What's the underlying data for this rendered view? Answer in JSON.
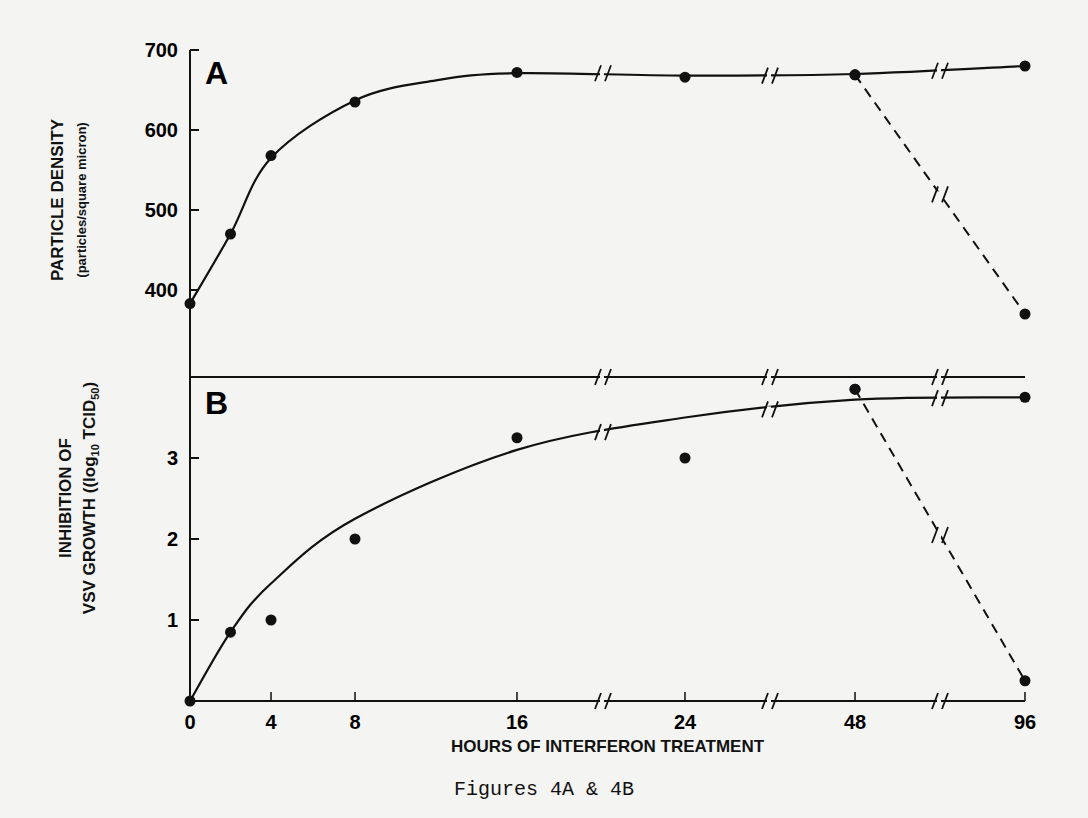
{
  "caption": "Figures 4A & 4B",
  "chart_data": [
    {
      "panel": "A",
      "type": "line",
      "title": "",
      "xlabel": "HOURS OF INTERFERON TREATMENT",
      "ylabel": "PARTICLE DENSITY",
      "ylabel_units": "(particles/square micron)",
      "x_ticks": [
        "0",
        "4",
        "8",
        "16",
        "24",
        "48",
        "96"
      ],
      "y_ticks": [
        "400",
        "500",
        "600",
        "700"
      ],
      "ylim": [
        360,
        700
      ],
      "x_axis_breaks": [
        "16-24",
        "24-48",
        "48-96"
      ],
      "series": [
        {
          "name": "interferon-treated (solid)",
          "style": "solid",
          "x": [
            0,
            2,
            4,
            8,
            16,
            24,
            48,
            96
          ],
          "values": [
            383,
            470,
            568,
            635,
            672,
            666,
            669,
            680
          ]
        },
        {
          "name": "interferon removed (dashed)",
          "style": "dashed",
          "x": [
            48,
            96
          ],
          "values": [
            669,
            370
          ]
        }
      ]
    },
    {
      "panel": "B",
      "type": "line",
      "title": "",
      "xlabel": "HOURS OF INTERFERON TREATMENT",
      "ylabel": "INHIBITION OF VSV GROWTH",
      "ylabel_units": "(log10 TCID50)",
      "x_ticks": [
        "0",
        "4",
        "8",
        "16",
        "24",
        "48",
        "96"
      ],
      "y_ticks": [
        "1",
        "2",
        "3"
      ],
      "ylim": [
        0,
        3.9
      ],
      "x_axis_breaks": [
        "16-24",
        "24-48",
        "48-96"
      ],
      "series": [
        {
          "name": "interferon-treated (solid)",
          "style": "solid",
          "x": [
            0,
            2,
            4,
            8,
            16,
            24,
            48,
            96
          ],
          "values": [
            0,
            0.85,
            1.0,
            2.0,
            3.25,
            3.0,
            3.85,
            3.75
          ]
        },
        {
          "name": "interferon removed (dashed)",
          "style": "dashed",
          "x": [
            48,
            96
          ],
          "values": [
            3.85,
            0.25
          ]
        }
      ]
    }
  ],
  "labels": {
    "panelA": "A",
    "panelB": "B",
    "yA_main": "PARTICLE DENSITY",
    "yA_units": "(particles/square micron)",
    "yB_main": "INHIBITION OF",
    "yB_units_prefix": "VSV GROWTH ((log",
    "yB_sub10": "10",
    "yB_mid": " TCID",
    "yB_sub50": "50",
    "yB_end": ")",
    "xlabel": "HOURS OF INTERFERON TREATMENT"
  }
}
